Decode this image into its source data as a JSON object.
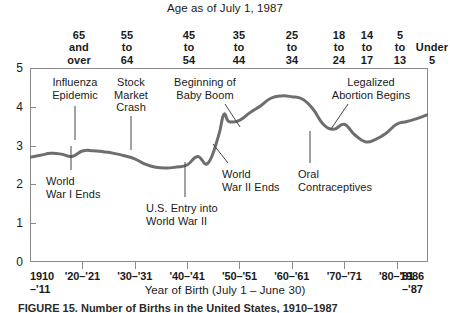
{
  "chart_data": {
    "type": "line",
    "title": "Age as of July 1, 1987",
    "xlabel": "Year of Birth (July 1 – June 30)",
    "ylabel": "",
    "xlim": [
      1910,
      1986
    ],
    "ylim": [
      0,
      5
    ],
    "grid": false,
    "legend": "none",
    "line_color": "#6e6e6e",
    "x": [
      1910,
      1912,
      1914,
      1916,
      1918,
      1920,
      1922,
      1924,
      1926,
      1928,
      1930,
      1932,
      1934,
      1936,
      1938,
      1940,
      1942,
      1944,
      1946,
      1947,
      1948,
      1950,
      1952,
      1954,
      1956,
      1958,
      1960,
      1962,
      1964,
      1966,
      1968,
      1970,
      1972,
      1974,
      1976,
      1978,
      1980,
      1982,
      1984,
      1986
    ],
    "values": [
      2.7,
      2.75,
      2.8,
      2.78,
      2.72,
      2.86,
      2.87,
      2.84,
      2.8,
      2.74,
      2.66,
      2.52,
      2.44,
      2.42,
      2.45,
      2.5,
      2.72,
      2.55,
      3.25,
      3.8,
      3.62,
      3.65,
      3.85,
      4.02,
      4.22,
      4.28,
      4.26,
      4.2,
      3.95,
      3.55,
      3.42,
      3.55,
      3.28,
      3.1,
      3.16,
      3.32,
      3.55,
      3.62,
      3.7,
      3.8
    ],
    "y_ticks": [
      0,
      1,
      2,
      3,
      4,
      5
    ],
    "x_ticks": [
      {
        "value": 1910,
        "label": "1910",
        "sub": "–'11",
        "position": "left-edge"
      },
      {
        "value": 1920,
        "label": "'20–'21",
        "sub": "",
        "position": "inner"
      },
      {
        "value": 1930,
        "label": "'30–'31",
        "sub": "",
        "position": "inner"
      },
      {
        "value": 1940,
        "label": "'40–'41",
        "sub": "",
        "position": "inner"
      },
      {
        "value": 1950,
        "label": "'50–'51",
        "sub": "",
        "position": "inner"
      },
      {
        "value": 1960,
        "label": "'60–'61",
        "sub": "",
        "position": "inner"
      },
      {
        "value": 1970,
        "label": "'70–'71",
        "sub": "",
        "position": "inner"
      },
      {
        "value": 1980,
        "label": "'80–'81",
        "sub": "",
        "position": "inner"
      },
      {
        "value": 1986,
        "label": "1986",
        "sub": "–'87",
        "position": "right-edge"
      }
    ],
    "secondary_axis": {
      "title": "Age as of July 1, 1987",
      "groups": [
        {
          "lines": [
            "65",
            "and",
            "over"
          ]
        },
        {
          "lines": [
            "55",
            "to",
            "64"
          ]
        },
        {
          "lines": [
            "45",
            "to",
            "54"
          ]
        },
        {
          "lines": [
            "35",
            "to",
            "44"
          ]
        },
        {
          "lines": [
            "25",
            "to",
            "34"
          ]
        },
        {
          "lines": [
            "18",
            "to",
            "24"
          ]
        },
        {
          "lines": [
            "14",
            "to",
            "17"
          ]
        },
        {
          "lines": [
            "5",
            "to",
            "13"
          ]
        },
        {
          "lines": [
            "Under",
            "5"
          ]
        }
      ]
    },
    "annotations": [
      {
        "text": "Influenza\nEpidemic",
        "align": "center"
      },
      {
        "text": "Stock\nMarket\nCrash",
        "align": "center"
      },
      {
        "text": "Beginning of\nBaby Boom",
        "align": "center"
      },
      {
        "text": "Legalized\nAbortion Begins",
        "align": "center"
      },
      {
        "text": "World\nWar I Ends",
        "align": "left"
      },
      {
        "text": "U.S. Entry into\nWorld War II",
        "align": "left"
      },
      {
        "text": "World\nWar II Ends",
        "align": "left"
      },
      {
        "text": "Oral\nContraceptives",
        "align": "left"
      }
    ]
  },
  "caption": {
    "text": "FIGURE 15.   Number of Births in the United States, 1910–1987"
  }
}
